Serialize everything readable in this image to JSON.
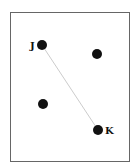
{
  "diagram": {
    "frame": {
      "x": 10,
      "y": 12,
      "width": 120,
      "height": 150,
      "stroke": "#666666"
    },
    "points": [
      {
        "id": "J",
        "label": "J",
        "x": 42,
        "y": 45,
        "r": 5,
        "label_x": 30,
        "label_y": 49
      },
      {
        "id": "P2",
        "label": "",
        "x": 97,
        "y": 54,
        "r": 5
      },
      {
        "id": "P3",
        "label": "",
        "x": 43,
        "y": 104,
        "r": 5
      },
      {
        "id": "K",
        "label": "K",
        "x": 98,
        "y": 130,
        "r": 5,
        "label_x": 105,
        "label_y": 134
      }
    ],
    "segments": [
      {
        "from": "J",
        "to": "K",
        "stroke": "#cccccc"
      }
    ],
    "colors": {
      "point": "#111111",
      "line": "#cccccc"
    }
  }
}
